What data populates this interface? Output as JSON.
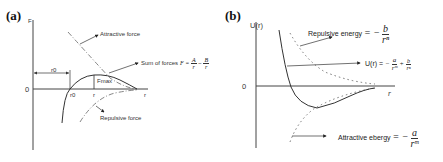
{
  "panels": [
    {
      "tag": "(a)",
      "y_axis_label": "F",
      "x_axis_label": "r",
      "origin_label": "0",
      "r0_label": "r0",
      "r0_bracket_label": "r0",
      "r1_label": "r",
      "fmax_label": "Fmax",
      "curves": {
        "attractive": "Attractive force",
        "sum": "Sum of forces",
        "repulsive": "Repulsive force"
      },
      "sum_formula": {
        "lhs": "F =",
        "term1_num": "A",
        "term1_den": "r",
        "op": "−",
        "term2_num": "B",
        "term2_den": "r"
      }
    },
    {
      "tag": "(b)",
      "y_axis_label": "U(r)",
      "x_axis_label": "r",
      "origin_label": "0",
      "curves": {
        "repulsive_label": "Repulsive energy",
        "repulsive_formula": {
          "lhs": "= −",
          "num": "b",
          "den": "rⁿ"
        },
        "total_label": "U(r) =",
        "total_formula": {
          "t1_sign": "−",
          "t1_num": "a",
          "t1_den": "rᵐ",
          "t2_sign": "+",
          "t2_num": "b",
          "t2_den": "rⁿ"
        },
        "attractive_label": "Attractive ebergy",
        "attractive_formula": {
          "lhs": "= −",
          "num": "a",
          "den": "rᵐ"
        }
      }
    }
  ]
}
